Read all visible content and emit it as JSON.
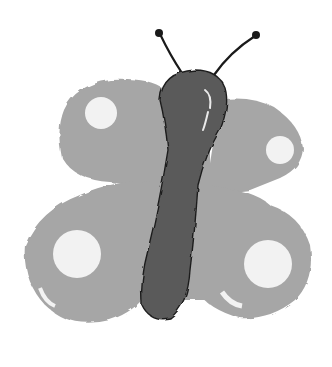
{
  "illustration": {
    "subject": "butterfly",
    "style": "watercolor, grayscale",
    "colors": {
      "background": "#ffffff",
      "wing": "#a6a6a6",
      "spot": "#f2f2f2",
      "body": "#5a5a5a",
      "outline": "#1e1e1e",
      "antenna": "#1a1a1a"
    }
  }
}
